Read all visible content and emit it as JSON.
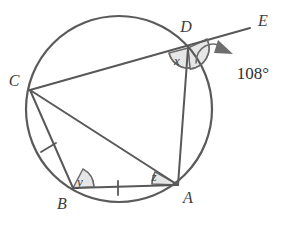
{
  "figure": {
    "type": "circle-geometry-diagram",
    "background_color": "#ffffff",
    "line_color": "#585858",
    "arc_fill_color": "#e2e2e2",
    "arc_stroke_color": "#6a6a6a",
    "text_color": "#3c3c3c"
  },
  "circle": {
    "name": "main-circle",
    "center_x": 119,
    "center_y": 109,
    "radius": 93
  },
  "points": [
    {
      "id": "C",
      "label": "C",
      "x": 30,
      "y": 90,
      "label_x": 14,
      "label_y": 86
    },
    {
      "id": "D",
      "label": "D",
      "x": 188,
      "y": 48,
      "label_x": 186,
      "label_y": 32
    },
    {
      "id": "A",
      "label": "A",
      "x": 178,
      "y": 185,
      "label_x": 186,
      "label_y": 201
    },
    {
      "id": "B",
      "label": "B",
      "x": 73,
      "y": 188,
      "label_x": 60,
      "label_y": 208
    },
    {
      "id": "E",
      "label": "E",
      "x": 250,
      "y": 28,
      "label_x": 262,
      "label_y": 25
    }
  ],
  "segments": [
    {
      "name": "segment-C-E",
      "from": "C",
      "to": "E",
      "note": "secant through D extended to E"
    },
    {
      "name": "segment-C-A",
      "from": "C",
      "to": "A",
      "note": "chord CA, diagonal"
    },
    {
      "name": "segment-C-B",
      "from": "C",
      "to": "B",
      "note": "chord CB, tick-marked"
    },
    {
      "name": "segment-B-A",
      "from": "B",
      "to": "A",
      "note": "chord BA, tick-marked"
    },
    {
      "name": "segment-D-A",
      "from": "D",
      "to": "A",
      "note": "chord DA"
    }
  ],
  "tick_marks": [
    {
      "name": "tick-segment-CB",
      "x": 48,
      "y": 147,
      "rotation": -62,
      "count": 1
    },
    {
      "name": "tick-segment-BA",
      "x": 118,
      "y": 188,
      "rotation": 2,
      "count": 1
    }
  ],
  "angles": [
    {
      "name": "angle-x-at-D",
      "label": "x",
      "vertex": "D",
      "label_x": 177,
      "label_y": 64,
      "description": "interior angle CDA of the cyclic quadrilateral"
    },
    {
      "name": "angle-y-at-B",
      "label": "y",
      "vertex": "B",
      "label_x": 80,
      "label_y": 184,
      "description": "interior angle CBA"
    },
    {
      "name": "angle-z-at-A",
      "label": "z",
      "vertex": "A",
      "label_x": 152,
      "label_y": 180,
      "description": "angle CAB"
    },
    {
      "name": "angle-exterior-at-D",
      "label": "108°",
      "value": 108,
      "unit": "degrees",
      "vertex": "D",
      "label_x": 253,
      "label_y": 78,
      "description": "exterior angle ADE marked 108 degrees"
    }
  ],
  "annotations": {
    "arrow": {
      "name": "angle-indicator-arrow",
      "description": "curved arrow pointing from the exterior arc toward the 108 degree label"
    }
  }
}
